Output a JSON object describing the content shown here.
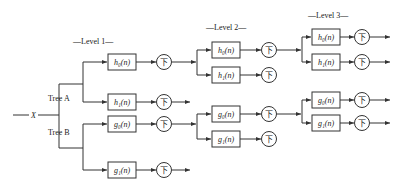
{
  "diagram": {
    "input_label": "X",
    "trees": [
      {
        "label": "Tree A"
      },
      {
        "label": "Tree B"
      }
    ],
    "levels": [
      {
        "label": "—Level 1—"
      },
      {
        "label": "—Level 2—"
      },
      {
        "label": "—Level 3—"
      }
    ],
    "downsample_symbol": "下",
    "filters": {
      "l1_h0": "h₀(n)",
      "l1_h1": "h₁(n)",
      "l1_g0": "g₀(n)",
      "l1_g1": "g₁(n)",
      "l2_h0": "h₀(n)",
      "l2_h1": "h₁(n)",
      "l2_g0": "g₀(n)",
      "l2_g1": "g₁(n)",
      "l3_h0": "h₀(n)",
      "l3_h1": "h₁(n)",
      "l3_g0": "g₀(n)",
      "l3_g1": "g₁(n)"
    },
    "colors": {
      "line": "#333333",
      "background": "#ffffff"
    }
  }
}
